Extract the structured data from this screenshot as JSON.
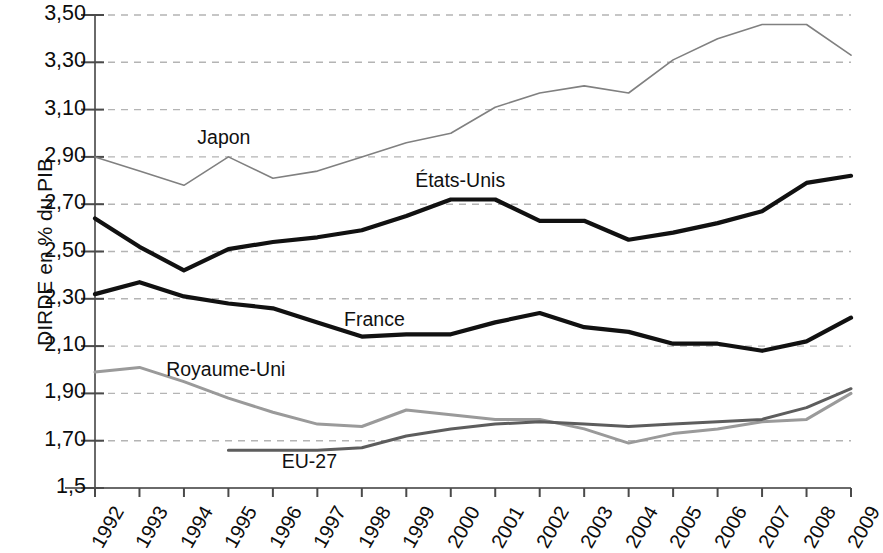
{
  "chart_data": {
    "type": "line",
    "title": "",
    "xlabel": "",
    "ylabel": "DIRDE en % du PIB",
    "categories": [
      "1992",
      "1993",
      "1994",
      "1995",
      "1996",
      "1997",
      "1998",
      "1999",
      "2000",
      "2001",
      "2002",
      "2003",
      "2004",
      "2005",
      "2006",
      "2007",
      "2008",
      "2009"
    ],
    "x": [
      1992,
      1993,
      1994,
      1995,
      1996,
      1997,
      1998,
      1999,
      2000,
      2001,
      2002,
      2003,
      2004,
      2005,
      2006,
      2007,
      2008,
      2009
    ],
    "ylim": [
      1.5,
      3.5
    ],
    "ytick_labels": [
      "3,50",
      "3,30",
      "3,10",
      "2,90",
      "2,70",
      "2,50",
      "2,30",
      "2,10",
      "1,90",
      "1,70",
      "1,5"
    ],
    "ytick_values": [
      3.5,
      3.3,
      3.1,
      2.9,
      2.7,
      2.5,
      2.3,
      2.1,
      1.9,
      1.7,
      1.5
    ],
    "grid": true,
    "legend_position": "inline-annotations",
    "series": [
      {
        "name": "Japon",
        "color": "#808080",
        "width": 1.6,
        "label_x": 1994.3,
        "label_y": 2.98,
        "values": [
          2.9,
          2.84,
          2.78,
          2.9,
          2.81,
          2.84,
          2.9,
          2.96,
          3.0,
          3.11,
          3.17,
          3.2,
          3.17,
          3.31,
          3.4,
          3.46,
          3.46,
          3.33
        ]
      },
      {
        "name": "États-Unis",
        "color": "#111111",
        "width": 4.2,
        "label_x": 1999.2,
        "label_y": 2.8,
        "values": [
          2.64,
          2.52,
          2.42,
          2.51,
          2.54,
          2.56,
          2.59,
          2.65,
          2.72,
          2.72,
          2.63,
          2.63,
          2.55,
          2.58,
          2.62,
          2.67,
          2.79,
          2.82
        ]
      },
      {
        "name": "France",
        "color": "#111111",
        "width": 4.2,
        "label_x": 1997.6,
        "label_y": 2.21,
        "values": [
          2.32,
          2.37,
          2.31,
          2.28,
          2.26,
          2.2,
          2.14,
          2.15,
          2.15,
          2.2,
          2.24,
          2.18,
          2.16,
          2.11,
          2.11,
          2.08,
          2.12,
          2.22
        ]
      },
      {
        "name": "Royaume-Uni",
        "color": "#9a9a9a",
        "width": 3.0,
        "label_x": 1993.6,
        "label_y": 2.0,
        "values": [
          1.99,
          2.01,
          1.95,
          1.88,
          1.82,
          1.77,
          1.76,
          1.83,
          1.81,
          1.79,
          1.79,
          1.75,
          1.69,
          1.73,
          1.75,
          1.78,
          1.79,
          1.9
        ]
      },
      {
        "name": "EU-27",
        "color": "#5d5d5d",
        "width": 3.0,
        "label_x": 1996.2,
        "label_y": 1.61,
        "start_index": 3,
        "values": [
          null,
          null,
          null,
          1.66,
          1.66,
          1.66,
          1.67,
          1.72,
          1.75,
          1.77,
          1.78,
          1.77,
          1.76,
          1.77,
          1.78,
          1.79,
          1.84,
          1.92
        ]
      }
    ]
  }
}
